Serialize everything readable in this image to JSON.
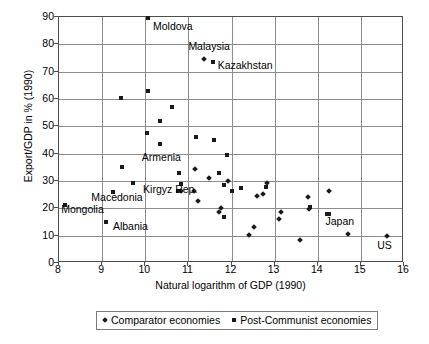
{
  "chart_data": {
    "type": "scatter",
    "title": "",
    "xlabel": "Natural logarithm of GDP (1990)",
    "ylabel": "Export/GDP in % (1990)",
    "xlim": [
      8,
      16
    ],
    "ylim": [
      0,
      90
    ],
    "xticks": [
      8,
      9,
      10,
      11,
      12,
      13,
      14,
      15,
      16
    ],
    "yticks": [
      0,
      10,
      20,
      30,
      40,
      50,
      60,
      70,
      80,
      90
    ],
    "grid": true,
    "legend_position": "below-plot",
    "series": [
      {
        "name": "Comparator economies",
        "marker": "diamond",
        "color": "#1a1a1a",
        "points": [
          {
            "x": 11.37,
            "y": 74.5,
            "label": "Malaysia"
          },
          {
            "x": 10.83,
            "y": 26.4,
            "label": ""
          },
          {
            "x": 11.15,
            "y": 34.5,
            "label": ""
          },
          {
            "x": 11.12,
            "y": 26.4,
            "label": ""
          },
          {
            "x": 11.22,
            "y": 22.6,
            "label": ""
          },
          {
            "x": 11.47,
            "y": 31.0,
            "label": ""
          },
          {
            "x": 11.7,
            "y": 18.6,
            "label": ""
          },
          {
            "x": 11.76,
            "y": 20.2,
            "label": ""
          },
          {
            "x": 11.92,
            "y": 30.0,
            "label": ""
          },
          {
            "x": 12.4,
            "y": 10.4,
            "label": ""
          },
          {
            "x": 12.53,
            "y": 13.3,
            "label": ""
          },
          {
            "x": 12.58,
            "y": 24.5,
            "label": ""
          },
          {
            "x": 12.74,
            "y": 25.4,
            "label": ""
          },
          {
            "x": 12.83,
            "y": 29.2,
            "label": ""
          },
          {
            "x": 13.1,
            "y": 16.2,
            "label": ""
          },
          {
            "x": 13.14,
            "y": 18.8,
            "label": ""
          },
          {
            "x": 13.58,
            "y": 8.4,
            "label": ""
          },
          {
            "x": 13.78,
            "y": 24.0,
            "label": ""
          },
          {
            "x": 13.8,
            "y": 19.8,
            "label": ""
          },
          {
            "x": 14.25,
            "y": 26.2,
            "label": ""
          },
          {
            "x": 14.71,
            "y": 10.7,
            "label": ""
          },
          {
            "x": 15.6,
            "y": 9.8,
            "label": "US"
          }
        ]
      },
      {
        "name": "Post-Communist economies",
        "marker": "square",
        "color": "#1a1a1a",
        "points": [
          {
            "x": 10.06,
            "y": 89.5,
            "label": "Moldova"
          },
          {
            "x": 11.58,
            "y": 73.7,
            "label": "Kazakhstan"
          },
          {
            "x": 10.06,
            "y": 63.0,
            "label": ""
          },
          {
            "x": 9.43,
            "y": 60.2,
            "label": ""
          },
          {
            "x": 10.62,
            "y": 57.0,
            "label": ""
          },
          {
            "x": 10.35,
            "y": 52.0,
            "label": ""
          },
          {
            "x": 10.05,
            "y": 47.6,
            "label": ""
          },
          {
            "x": 11.59,
            "y": 45.0,
            "label": ""
          },
          {
            "x": 11.18,
            "y": 46.1,
            "label": ""
          },
          {
            "x": 10.35,
            "y": 43.4,
            "label": ""
          },
          {
            "x": 11.9,
            "y": 39.5,
            "label": ""
          },
          {
            "x": 9.45,
            "y": 35.0,
            "label": "Armenia"
          },
          {
            "x": 10.78,
            "y": 33.0,
            "label": ""
          },
          {
            "x": 11.7,
            "y": 33.0,
            "label": ""
          },
          {
            "x": 9.72,
            "y": 29.2,
            "label": "Kirgyz Rep."
          },
          {
            "x": 10.84,
            "y": 28.8,
            "label": ""
          },
          {
            "x": 11.82,
            "y": 28.6,
            "label": ""
          },
          {
            "x": 12.8,
            "y": 27.7,
            "label": ""
          },
          {
            "x": 12.22,
            "y": 27.5,
            "label": ""
          },
          {
            "x": 9.25,
            "y": 26.0,
            "label": "Macedonia"
          },
          {
            "x": 10.75,
            "y": 26.2,
            "label": ""
          },
          {
            "x": 12.0,
            "y": 26.3,
            "label": ""
          },
          {
            "x": 8.15,
            "y": 21.3,
            "label": "Mongolia"
          },
          {
            "x": 13.82,
            "y": 20.6,
            "label": ""
          },
          {
            "x": 14.22,
            "y": 17.9,
            "label": "Japan"
          },
          {
            "x": 14.27,
            "y": 17.8,
            "label": ""
          },
          {
            "x": 11.82,
            "y": 16.9,
            "label": ""
          },
          {
            "x": 9.1,
            "y": 15.1,
            "label": "Albania"
          }
        ]
      }
    ],
    "annotations": [
      {
        "text": "Moldova",
        "x": 10.18,
        "y": 86.5,
        "anchor": "left"
      },
      {
        "text": "Malaysia",
        "x": 11.0,
        "y": 79.0,
        "anchor": "left"
      },
      {
        "text": "Kazakhstan",
        "x": 11.68,
        "y": 72.0,
        "anchor": "left"
      },
      {
        "text": "Armenia",
        "x": 9.92,
        "y": 38.5,
        "anchor": "left"
      },
      {
        "text": "Kirgyz Rep.",
        "x": 9.95,
        "y": 26.8,
        "anchor": "left"
      },
      {
        "text": "Macedonia",
        "x": 8.75,
        "y": 23.6,
        "anchor": "left"
      },
      {
        "text": "Mongolia",
        "x": 8.05,
        "y": 19.4,
        "anchor": "left"
      },
      {
        "text": "Albania",
        "x": 9.25,
        "y": 13.1,
        "anchor": "left"
      },
      {
        "text": "Japan",
        "x": 14.18,
        "y": 14.9,
        "anchor": "left"
      },
      {
        "text": "US",
        "x": 15.38,
        "y": 6.3,
        "anchor": "left"
      }
    ]
  },
  "axes": {
    "x_title": "Natural logarithm of GDP (1990)",
    "y_title": "Export/GDP in % (1990)",
    "x_tick_labels": [
      "8",
      "9",
      "10",
      "11",
      "12",
      "13",
      "14",
      "15",
      "16"
    ],
    "y_tick_labels": [
      "0",
      "10",
      "20",
      "30",
      "40",
      "50",
      "60",
      "70",
      "80",
      "90"
    ]
  },
  "legend": {
    "items": [
      {
        "label": "Comparator economies",
        "marker": "diamond"
      },
      {
        "label": "Post-Communist economies",
        "marker": "square"
      }
    ]
  },
  "colors": {
    "marker": "#1a1a1a",
    "grid": "#8c8c8c",
    "frame": "#4d4d4d",
    "background": "#ffffff"
  }
}
